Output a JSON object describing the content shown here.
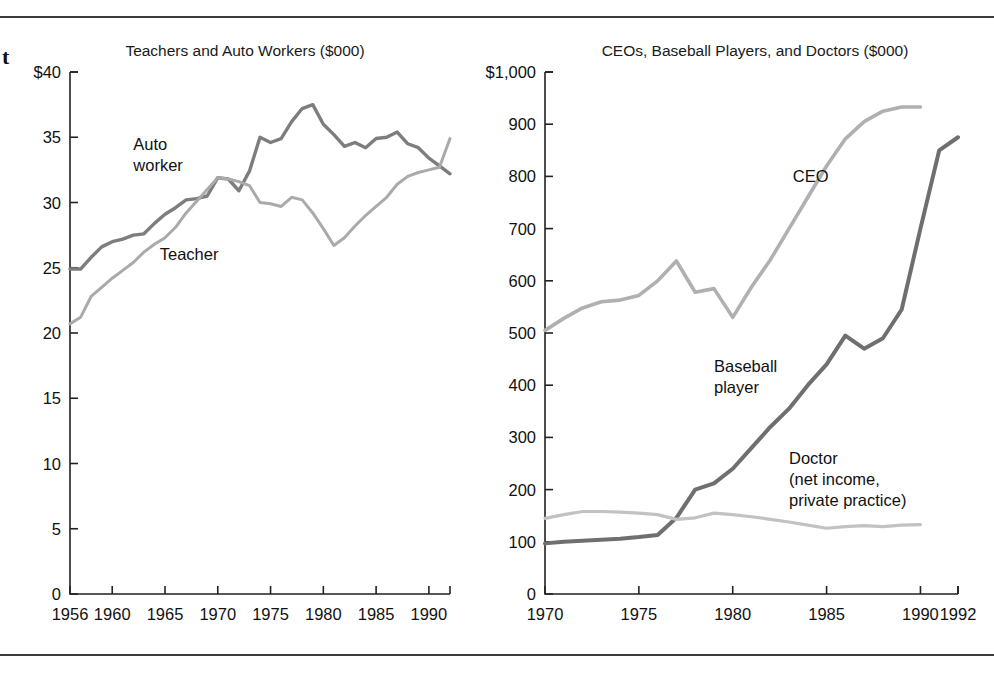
{
  "page": {
    "fragment_text": "t",
    "background": "#ffffff",
    "rule_color": "#3a3a3a"
  },
  "charts": [
    {
      "id": "teachers-auto-workers",
      "chart_data": {
        "type": "line",
        "title": "Teachers and Auto Workers ($000)",
        "xlabel": "",
        "ylabel": "",
        "xlim": [
          1956,
          1992
        ],
        "ylim": [
          0,
          40
        ],
        "grid": false,
        "legend": "inline-annotations",
        "y_ticks": [
          0,
          5,
          10,
          15,
          20,
          25,
          30,
          35,
          40
        ],
        "y_tick_labels": [
          "0",
          "5",
          "10",
          "15",
          "20",
          "25",
          "30",
          "35",
          "$40"
        ],
        "x_ticks": [
          1956,
          1960,
          1965,
          1970,
          1975,
          1980,
          1985,
          1990
        ],
        "x_tick_labels": [
          "1956",
          "1960",
          "1965",
          "1970",
          "1975",
          "1980",
          "1985",
          "1990"
        ],
        "series": [
          {
            "name": "Auto worker",
            "color": "#7d7d7d",
            "width": 3.4,
            "label_x": 1962.0,
            "label_y": 34.0,
            "label_lines": [
              "Auto",
              "worker"
            ],
            "x": [
              1956,
              1957,
              1958,
              1959,
              1960,
              1961,
              1962,
              1963,
              1964,
              1965,
              1966,
              1967,
              1968,
              1969,
              1970,
              1971,
              1972,
              1973,
              1974,
              1975,
              1976,
              1977,
              1978,
              1979,
              1980,
              1981,
              1982,
              1983,
              1984,
              1985,
              1986,
              1987,
              1988,
              1989,
              1990,
              1991,
              1992
            ],
            "y": [
              24.9,
              24.9,
              25.8,
              26.6,
              27.0,
              27.2,
              27.5,
              27.6,
              28.4,
              29.1,
              29.6,
              30.2,
              30.3,
              30.5,
              31.9,
              31.8,
              30.9,
              32.4,
              35.0,
              34.6,
              34.9,
              36.2,
              37.2,
              37.5,
              36.0,
              35.2,
              34.3,
              34.6,
              34.2,
              34.9,
              35.0,
              35.4,
              34.5,
              34.2,
              33.4,
              32.8,
              32.2
            ]
          },
          {
            "name": "Teacher",
            "color": "#aaaaaa",
            "width": 3.0,
            "label_x": 1964.5,
            "label_y": 25.6,
            "label_lines": [
              "Teacher"
            ],
            "x": [
              1956,
              1957,
              1958,
              1959,
              1960,
              1961,
              1962,
              1963,
              1964,
              1965,
              1966,
              1967,
              1968,
              1969,
              1970,
              1971,
              1972,
              1973,
              1974,
              1975,
              1976,
              1977,
              1978,
              1979,
              1980,
              1981,
              1982,
              1983,
              1984,
              1985,
              1986,
              1987,
              1988,
              1989,
              1990,
              1991,
              1992
            ],
            "y": [
              20.7,
              21.2,
              22.8,
              23.5,
              24.2,
              24.8,
              25.4,
              26.2,
              26.8,
              27.3,
              28.1,
              29.2,
              30.1,
              31.0,
              31.9,
              31.8,
              31.6,
              31.3,
              30.0,
              29.9,
              29.7,
              30.4,
              30.2,
              29.2,
              28.0,
              26.7,
              27.3,
              28.2,
              29.0,
              29.7,
              30.4,
              31.4,
              32.0,
              32.3,
              32.5,
              32.7,
              34.9
            ]
          }
        ],
        "notes": "Auto worker line ends 1992 with a final spike to ~34.9 then 32.2; teacher line rises at the end."
      }
    },
    {
      "id": "ceos-baseball-doctors",
      "chart_data": {
        "type": "line",
        "title": "CEOs, Baseball Players, and Doctors ($000)",
        "xlabel": "",
        "ylabel": "",
        "xlim": [
          1970,
          1992
        ],
        "ylim": [
          0,
          1000
        ],
        "grid": false,
        "legend": "inline-annotations",
        "y_ticks": [
          0,
          100,
          200,
          300,
          400,
          500,
          600,
          700,
          800,
          900,
          1000
        ],
        "y_tick_labels": [
          "0",
          "100",
          "200",
          "300",
          "400",
          "500",
          "600",
          "700",
          "800",
          "900",
          "$1,000"
        ],
        "x_ticks": [
          1970,
          1975,
          1980,
          1985,
          1990,
          1992
        ],
        "x_tick_labels": [
          "1970",
          "1975",
          "1980",
          "1985",
          "1990",
          "1992"
        ],
        "series": [
          {
            "name": "CEO",
            "color": "#b0b0b0",
            "width": 3.6,
            "label_x": 1983.2,
            "label_y": 790,
            "label_lines": [
              "CEO"
            ],
            "x": [
              1970,
              1971,
              1972,
              1973,
              1974,
              1975,
              1976,
              1977,
              1978,
              1979,
              1980,
              1981,
              1982,
              1983,
              1984,
              1985,
              1986,
              1987,
              1988,
              1989,
              1990
            ],
            "y": [
              505,
              528,
              548,
              560,
              563,
              572,
              600,
              638,
              578,
              585,
              530,
              588,
              640,
              700,
              760,
              820,
              872,
              905,
              925,
              933,
              933
            ]
          },
          {
            "name": "Baseball player",
            "color": "#6f6f6f",
            "width": 4.0,
            "label_x": 1979.0,
            "label_y": 425,
            "label_lines": [
              "Baseball",
              "player"
            ],
            "x": [
              1970,
              1971,
              1972,
              1973,
              1974,
              1975,
              1976,
              1977,
              1978,
              1979,
              1980,
              1981,
              1982,
              1983,
              1984,
              1985,
              1986,
              1987,
              1988,
              1989,
              1990,
              1991,
              1992
            ],
            "y": [
              97,
              100,
              102,
              104,
              106,
              109,
              113,
              146,
              200,
              212,
              240,
              280,
              320,
              355,
              400,
              440,
              495,
              470,
              490,
              545,
              700,
              850,
              875
            ]
          },
          {
            "name": "Doctor (net income, private practice)",
            "color": "#c2c2c2",
            "width": 3.2,
            "label_x": 1983.0,
            "label_y": 250,
            "label_lines": [
              "Doctor",
              "(net income,",
              "private practice)"
            ],
            "x": [
              1970,
              1971,
              1972,
              1973,
              1974,
              1975,
              1976,
              1977,
              1978,
              1979,
              1980,
              1981,
              1982,
              1983,
              1984,
              1985,
              1986,
              1987,
              1988,
              1989,
              1990
            ],
            "y": [
              145,
              152,
              158,
              158,
              157,
              155,
              152,
              143,
              146,
              155,
              152,
              148,
              143,
              138,
              132,
              126,
              129,
              131,
              129,
              132,
              133
            ]
          }
        ],
        "notes": "CEO series ends 1990; Doctor series ends 1990; Baseball player extends to 1992."
      }
    }
  ]
}
